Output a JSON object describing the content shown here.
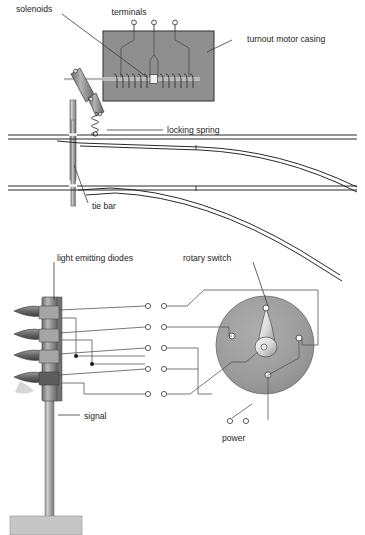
{
  "figure": {
    "panels": [
      {
        "id": "turnout-motor",
        "name": "Turnout motor over point work",
        "labels": [
          {
            "key": "solenoids",
            "text": "solenoids"
          },
          {
            "key": "terminals",
            "text": "terminals"
          },
          {
            "key": "casing",
            "text": "turnout motor casing"
          },
          {
            "key": "locking_spring",
            "text": "locking spring"
          },
          {
            "key": "tie_bar",
            "text": "tie bar"
          }
        ],
        "terminal_count": 3,
        "solenoid_coil_turns": 16
      },
      {
        "id": "signal-wiring",
        "name": "Light emitting diode signal and rotary switch",
        "labels": [
          {
            "key": "leds",
            "text": "light emitting diodes"
          },
          {
            "key": "rotary_switch",
            "text": "rotary switch"
          },
          {
            "key": "signal",
            "text": "signal"
          },
          {
            "key": "power",
            "text": "power"
          }
        ],
        "led_count": 4,
        "terminal_rows": 5,
        "switch_contacts": 4
      }
    ]
  },
  "colors": {
    "casing_fill": "#8f8f8f",
    "casing_stroke": "#3a3a3a",
    "switch_fill": "#9a9a9a",
    "metal_dark": "#6e6e6e",
    "metal_mid": "#9c9c9c",
    "metal_light": "#c9c9c9",
    "rail": "#2a2a2a",
    "wire": "#555555",
    "text": "#1e1e1e",
    "background": "#ffffff"
  }
}
